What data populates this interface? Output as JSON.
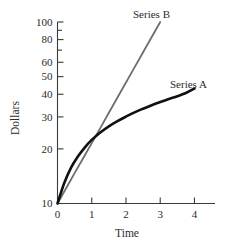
{
  "chart_data": {
    "type": "line",
    "title": "",
    "xlabel": "Time",
    "ylabel": "Dollars",
    "xlim": [
      0,
      4.6
    ],
    "ylim": [
      10,
      100
    ],
    "yscale": "log",
    "xscale": "linear",
    "grid": false,
    "legend_position": "inline-right-of-curve-ends",
    "x_ticks": [
      0,
      1,
      2,
      3,
      4
    ],
    "x_tick_labels": [
      "0",
      "1",
      "2",
      "3",
      "4"
    ],
    "y_ticks": [
      10,
      20,
      30,
      40,
      50,
      60,
      80,
      100
    ],
    "y_tick_labels": [
      "10",
      "20",
      "30",
      "40",
      "50",
      "60",
      "80",
      "100"
    ],
    "y_minor_ticks": [
      70,
      90
    ],
    "series": [
      {
        "name": "Series A",
        "color": "#111111",
        "linewidth": 2.6,
        "label_text": "Series A",
        "x": [
          0,
          0.2,
          0.4,
          0.6,
          0.8,
          1.0,
          1.25,
          1.5,
          1.75,
          2.0,
          2.25,
          2.5,
          2.75,
          3.0,
          3.25,
          3.5,
          3.75,
          4.0
        ],
        "y": [
          10,
          13,
          15.8,
          18.2,
          20.4,
          22.4,
          24.6,
          26.6,
          28.4,
          30.1,
          31.8,
          33.3,
          34.8,
          36.2,
          37.6,
          39.0,
          40.6,
          43.0
        ]
      },
      {
        "name": "Series B",
        "color": "#6e6e6e",
        "linewidth": 1.8,
        "label_text": "Series B",
        "x": [
          0,
          0.5,
          1.0,
          1.5,
          2.0,
          2.5,
          3.0
        ],
        "y": [
          10,
          14.7,
          21.5,
          31.6,
          46.4,
          68.1,
          100
        ]
      }
    ],
    "annotations": [
      {
        "text": "Series B",
        "x_px": 133,
        "y_px": 18
      },
      {
        "text": "Series A",
        "x_px": 170,
        "y_px": 88
      }
    ]
  },
  "axes": {
    "y_axis_title": "Dollars",
    "x_axis_title": "Time"
  }
}
